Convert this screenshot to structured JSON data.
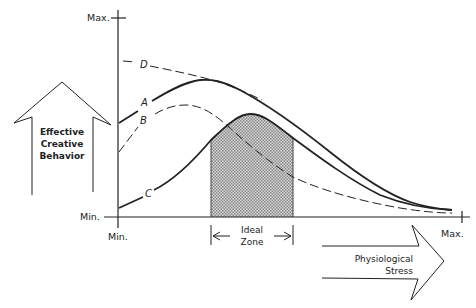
{
  "diagram": {
    "y_axis": {
      "max_label": "Max.",
      "min_label": "Min."
    },
    "x_axis": {
      "min_label": "Min.",
      "max_label": "Max."
    },
    "y_arrow": {
      "lines": [
        "Effective",
        "Creative",
        "Behavior"
      ]
    },
    "x_arrow": {
      "lines": [
        "Physiological",
        "Stress"
      ]
    },
    "ideal_zone": {
      "lines": [
        "Ideal",
        "Zone"
      ]
    },
    "curves": [
      {
        "id": "A",
        "label": "A",
        "style": "solid"
      },
      {
        "id": "B",
        "label": "B",
        "style": "dashed"
      },
      {
        "id": "C",
        "label": "C",
        "style": "solid"
      },
      {
        "id": "D",
        "label": "D",
        "style": "dashed"
      }
    ],
    "colors": {
      "ink": "#222222",
      "shade": "#bdbdbd",
      "background": "#ffffff"
    }
  }
}
